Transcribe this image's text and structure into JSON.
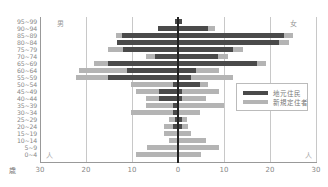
{
  "chart_data": {
    "type": "bar",
    "orientation": "horizontal",
    "subtype": "population-pyramid",
    "title": "",
    "categories": [
      "95~99",
      "90~94",
      "85~89",
      "80~84",
      "75~79",
      "70~74",
      "65~69",
      "60~64",
      "55~59",
      "50~54",
      "45~49",
      "40~44",
      "35~39",
      "30~34",
      "25~29",
      "20~24",
      "15~19",
      "10~14",
      "5~9",
      "0~4"
    ],
    "ylabel": "歳",
    "xlabel": "人",
    "left_label": "男",
    "right_label": "女",
    "x_ticks": [
      "30",
      "20",
      "10",
      "0",
      "10",
      "20",
      "30"
    ],
    "xlim": [
      -30,
      30
    ],
    "grid": "vertical at ±10, ±20",
    "legend_position": "right-middle inside",
    "series": [
      {
        "name": "地元住民",
        "color": "#4a4a4a",
        "male": [
          0.7,
          4.3,
          12.2,
          13.2,
          12.0,
          5.0,
          15.2,
          11.1,
          15.2,
          1.1,
          4.1,
          4.1,
          1.1,
          1.1,
          0.7,
          1.1,
          0,
          0,
          0,
          0
        ],
        "female": [
          0.8,
          6.5,
          23.0,
          22.0,
          12.0,
          8.7,
          17.2,
          3.9,
          2.8,
          4.8,
          0.8,
          0.9,
          0,
          0,
          0.8,
          0.8,
          0,
          0,
          0,
          0
        ]
      },
      {
        "name": "新規定住者",
        "color": "#b4b4b4",
        "note": "total (stacked outer extent) incl. 地元住民",
        "male": [
          0.7,
          4.3,
          13.5,
          13.2,
          15.3,
          7.0,
          18.3,
          21.5,
          22.2,
          10.2,
          9.1,
          7.0,
          7.0,
          10.2,
          2.0,
          3.0,
          3.0,
          2.0,
          6.8,
          9.1
        ],
        "female": [
          0.8,
          8.0,
          25.0,
          24.1,
          14.1,
          10.9,
          19.1,
          8.9,
          12.0,
          6.5,
          8.9,
          6.1,
          10.0,
          4.8,
          2.0,
          2.2,
          2.8,
          6.1,
          8.9,
          5.0
        ]
      }
    ]
  },
  "labels": {
    "male": "男",
    "female": "女",
    "age_unit": "歳",
    "people_unit_left": "人",
    "people_unit_right": "人"
  },
  "legend": {
    "items": [
      {
        "label": "地元住民",
        "color": "#4a4a4a"
      },
      {
        "label": "新規定住者",
        "color": "#b4b4b4"
      }
    ]
  }
}
